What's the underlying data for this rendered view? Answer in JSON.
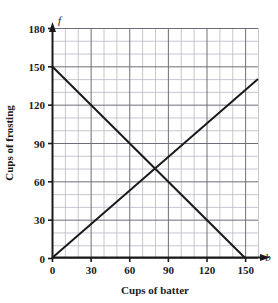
{
  "chart_data": {
    "type": "line",
    "title": "",
    "subtitle": "",
    "xlabel": "Cups of batter",
    "ylabel": "Cups of frosting",
    "x_variable": "b",
    "y_variable": "f",
    "xlim": [
      0,
      160
    ],
    "ylim": [
      0,
      180
    ],
    "x_ticks": [
      0,
      30,
      60,
      90,
      120,
      150
    ],
    "y_ticks": [
      0,
      30,
      60,
      90,
      120,
      150,
      180
    ],
    "x_tick_labels": [
      "0",
      "30",
      "60",
      "90",
      "120",
      "150"
    ],
    "y_tick_labels": [
      "0",
      "30",
      "60",
      "90",
      "120",
      "150",
      "180"
    ],
    "grid": true,
    "grid_minor_step": 10,
    "grid_major_step": 30,
    "legend": "none",
    "axis_arrows": true,
    "series": [
      {
        "name": "descending-line",
        "points": [
          [
            0,
            150
          ],
          [
            150,
            0
          ]
        ],
        "color": "#1a1a1a",
        "equation": "f = 150 - b"
      },
      {
        "name": "ascending-line",
        "points": [
          [
            0,
            0
          ],
          [
            160,
            140
          ]
        ],
        "color": "#1a1a1a",
        "equation": "f = 0.875 b"
      }
    ],
    "intersection": [
      80,
      70
    ],
    "annotations": []
  },
  "axes": {
    "y_axis_variable_label": "f",
    "x_axis_variable_label": "b",
    "y_axis_title": "Cups of frosting",
    "x_axis_title": "Cups of batter"
  },
  "colors": {
    "line": "#1a1a1a",
    "axis": "#1a1a1a",
    "grid_minor": "#b9b9c4",
    "grid_major": "#6e6e78",
    "background": "#ffffff",
    "text": "#1a1a1a"
  }
}
